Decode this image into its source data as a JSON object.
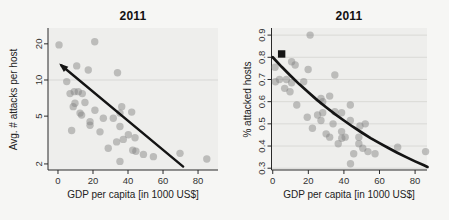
{
  "figure": {
    "background": "#f6f6f4",
    "panel_background": "#eeeeec",
    "gridline_color": "#d9d9d6",
    "axis_color": "#2a2a2a",
    "tick_text_color": "#333333",
    "point_color": "#7f7f7f",
    "point_opacity": 0.45,
    "trend_color": "#141414"
  },
  "chart_data": [
    {
      "type": "scatter",
      "title": "2011",
      "xlabel": "GDP per capita [in 1000 US$]",
      "ylabel": "Avg. # attacks per host",
      "x_ticks": [
        0,
        20,
        40,
        60,
        80
      ],
      "y_ticks": [
        2,
        5,
        10,
        20
      ],
      "y_scale": "log",
      "xlim": [
        -5.7,
        91.4
      ],
      "ylim": [
        1.78,
        27.1
      ],
      "gridlines_y": [
        10
      ],
      "legend": "none",
      "points": [
        [
          0.6,
          19.6
        ],
        [
          21,
          20.8
        ],
        [
          10.7,
          13.1
        ],
        [
          17.3,
          12.1
        ],
        [
          34,
          11.5
        ],
        [
          5,
          9.7
        ],
        [
          6.9,
          7.7
        ],
        [
          9.3,
          8.0
        ],
        [
          11.6,
          8.0
        ],
        [
          13.9,
          7.7
        ],
        [
          9.7,
          6.4
        ],
        [
          15.4,
          6.5
        ],
        [
          8.7,
          6.0
        ],
        [
          36.4,
          6.0
        ],
        [
          21.1,
          5.6
        ],
        [
          12.6,
          5.3
        ],
        [
          35.4,
          5.3
        ],
        [
          13.5,
          5.1
        ],
        [
          25.9,
          4.8
        ],
        [
          31.6,
          4.8
        ],
        [
          18.3,
          4.5
        ],
        [
          42.1,
          5.4
        ],
        [
          35.4,
          4.1
        ],
        [
          18.3,
          4.2
        ],
        [
          7.8,
          3.8
        ],
        [
          24,
          3.7
        ],
        [
          40.2,
          3.5
        ],
        [
          44,
          3.3
        ],
        [
          37.3,
          3.2
        ],
        [
          33.5,
          3.05
        ],
        [
          28.7,
          2.7
        ],
        [
          42.7,
          2.6
        ],
        [
          44.5,
          2.55
        ],
        [
          48.8,
          2.4
        ],
        [
          35.4,
          2.1
        ],
        [
          54.5,
          2.3
        ],
        [
          69.7,
          2.45
        ],
        [
          85,
          2.2
        ]
      ],
      "trend_line": {
        "shape": "straight",
        "arrow_at_start": true,
        "points": [
          [
            2,
            13.2
          ],
          [
            71.5,
            1.9
          ]
        ]
      }
    },
    {
      "type": "scatter",
      "title": "2011",
      "xlabel": "GDP per capita [in 1000 US$]",
      "ylabel": "% attacked hosts",
      "x_ticks": [
        0,
        20,
        40,
        60,
        80
      ],
      "y_ticks": [
        0.3,
        0.4,
        0.5,
        0.6,
        0.7,
        0.8,
        0.9
      ],
      "y_scale": "linear",
      "xlim": [
        -0.7,
        86.7
      ],
      "ylim": [
        0.292,
        0.932
      ],
      "gridlines_y": [
        0.3,
        0.4,
        0.5,
        0.6,
        0.7,
        0.8,
        0.9
      ],
      "legend": "none",
      "square_marker": [
        5,
        0.815
      ],
      "points": [
        [
          21,
          0.9
        ],
        [
          1.3,
          0.755
        ],
        [
          1.5,
          0.69
        ],
        [
          3.8,
          0.7
        ],
        [
          7.7,
          0.7
        ],
        [
          10.6,
          0.78
        ],
        [
          12.6,
          0.765
        ],
        [
          19.9,
          0.745
        ],
        [
          10.6,
          0.685
        ],
        [
          6.7,
          0.66
        ],
        [
          9.7,
          0.645
        ],
        [
          17.4,
          0.69
        ],
        [
          34.9,
          0.72
        ],
        [
          32,
          0.625
        ],
        [
          27.1,
          0.615
        ],
        [
          13.5,
          0.585
        ],
        [
          28.1,
          0.6
        ],
        [
          43.6,
          0.585
        ],
        [
          19.4,
          0.53
        ],
        [
          25.2,
          0.54
        ],
        [
          28.1,
          0.55
        ],
        [
          34.9,
          0.555
        ],
        [
          38.7,
          0.55
        ],
        [
          27.1,
          0.515
        ],
        [
          33.9,
          0.5
        ],
        [
          43.6,
          0.515
        ],
        [
          22.3,
          0.48
        ],
        [
          30,
          0.455
        ],
        [
          38.7,
          0.465
        ],
        [
          40.7,
          0.44
        ],
        [
          48.4,
          0.44
        ],
        [
          32,
          0.44
        ],
        [
          38.8,
          0.435
        ],
        [
          36.8,
          0.41
        ],
        [
          48.4,
          0.41
        ],
        [
          45.5,
          0.365
        ],
        [
          53.5,
          0.375
        ],
        [
          43.7,
          0.32
        ],
        [
          50.6,
          0.39
        ],
        [
          57.5,
          0.365
        ],
        [
          70.2,
          0.395
        ],
        [
          85.9,
          0.375
        ],
        [
          49,
          0.49
        ],
        [
          52,
          0.5
        ]
      ],
      "trend_curve": [
        [
          0,
          0.8
        ],
        [
          5,
          0.757
        ],
        [
          10,
          0.717
        ],
        [
          15,
          0.678
        ],
        [
          20,
          0.642
        ],
        [
          25,
          0.607
        ],
        [
          30,
          0.575
        ],
        [
          35,
          0.544
        ],
        [
          40,
          0.515
        ],
        [
          45,
          0.487
        ],
        [
          50,
          0.461
        ],
        [
          55,
          0.436
        ],
        [
          60,
          0.413
        ],
        [
          65,
          0.391
        ],
        [
          70,
          0.37
        ],
        [
          75,
          0.35
        ],
        [
          80,
          0.331
        ],
        [
          85,
          0.313
        ],
        [
          87,
          0.306
        ]
      ]
    }
  ]
}
